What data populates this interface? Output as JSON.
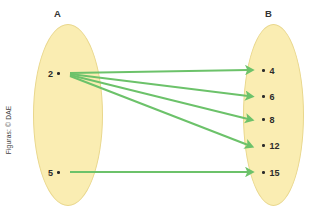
{
  "meta": {
    "clipped_top_text": "",
    "credit": "Figuras: © DAE"
  },
  "colors": {
    "set_fill": "#faedb2",
    "set_stroke": "#e9d78c",
    "arrow": "#6cc26a",
    "text": "#2b2b2b"
  },
  "sets": {
    "a": {
      "label": "A",
      "elements": [
        {
          "value": "2"
        },
        {
          "value": "5"
        }
      ]
    },
    "b": {
      "label": "B",
      "elements": [
        {
          "value": "4"
        },
        {
          "value": "6"
        },
        {
          "value": "8"
        },
        {
          "value": "12"
        },
        {
          "value": "15"
        }
      ]
    }
  },
  "mappings": [
    {
      "from": "2",
      "to": "4"
    },
    {
      "from": "2",
      "to": "6"
    },
    {
      "from": "2",
      "to": "8"
    },
    {
      "from": "2",
      "to": "12"
    },
    {
      "from": "5",
      "to": "15"
    }
  ]
}
